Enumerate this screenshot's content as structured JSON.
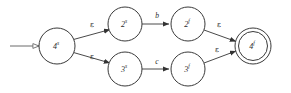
{
  "diagram": {
    "type": "finite-automaton",
    "title": "",
    "alphabet_symbols": [
      "b",
      "c"
    ],
    "epsilon_symbol": "ε",
    "colors": {
      "background": "#ffffff",
      "stroke": "#3a3a3a",
      "edge": "#4a4a4a",
      "text": "#2b2b2b"
    },
    "states": [
      {
        "id": "start",
        "base": "4",
        "sup": "s",
        "label": "4s",
        "cx": 57,
        "cy": 46,
        "r": 18,
        "is_start": true,
        "is_accept": false
      },
      {
        "id": "top-left",
        "base": "2",
        "sup": "s",
        "label": "2s",
        "cx": 125,
        "cy": 24,
        "r": 17,
        "is_start": false,
        "is_accept": false
      },
      {
        "id": "bottom-left",
        "base": "3",
        "sup": "s",
        "label": "3s",
        "cx": 125,
        "cy": 69,
        "r": 17,
        "is_start": false,
        "is_accept": false
      },
      {
        "id": "top-right",
        "base": "2",
        "sup": "f",
        "label": "2f",
        "cx": 188,
        "cy": 24,
        "r": 17,
        "is_start": false,
        "is_accept": false
      },
      {
        "id": "bottom-right",
        "base": "3",
        "sup": "f",
        "label": "3f",
        "cx": 188,
        "cy": 69,
        "r": 17,
        "is_start": false,
        "is_accept": false
      },
      {
        "id": "accept",
        "base": "4",
        "sup": "f",
        "label": "4f",
        "cx": 253,
        "cy": 46,
        "r": 18,
        "r_inner": 14.5,
        "is_start": false,
        "is_accept": true
      }
    ],
    "transitions": [
      {
        "id": "t1",
        "from": "start",
        "to": "top-left",
        "label": "ε",
        "is_epsilon": true,
        "label_x": 92,
        "label_y": 25
      },
      {
        "id": "t2",
        "from": "start",
        "to": "bottom-left",
        "label": "ε",
        "is_epsilon": true,
        "label_x": 92,
        "label_y": 57
      },
      {
        "id": "t3",
        "from": "top-left",
        "to": "top-right",
        "label": "b",
        "is_epsilon": false,
        "label_x": 157,
        "label_y": 16
      },
      {
        "id": "t4",
        "from": "bottom-left",
        "to": "bottom-right",
        "label": "c",
        "is_epsilon": false,
        "label_x": 157,
        "label_y": 62
      },
      {
        "id": "t5",
        "from": "top-right",
        "to": "accept",
        "label": "ε",
        "is_epsilon": true,
        "label_x": 219,
        "label_y": 25
      },
      {
        "id": "t6",
        "from": "bottom-right",
        "to": "accept",
        "label": "ε",
        "is_epsilon": true,
        "label_x": 217,
        "label_y": 50
      }
    ],
    "start_arrow": {
      "id": "start-arrow",
      "x1": 10,
      "y1": 46,
      "x2": 39,
      "y2": 46,
      "head_style": "hollow"
    }
  }
}
